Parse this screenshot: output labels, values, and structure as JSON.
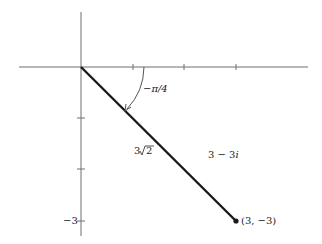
{
  "diagram": {
    "type": "complex-plane",
    "point": {
      "label": "(3, −3)",
      "complex": "3 − 3",
      "imag_unit": "i"
    },
    "modulus_label": {
      "coef": "3",
      "radicand": "2"
    },
    "angle_label": "−π/4",
    "y_tick_label": "−3",
    "x_ticks": [
      1,
      2,
      3
    ],
    "y_ticks": [
      -1,
      -2,
      -3
    ],
    "colors": {
      "axis": "#6e6e6e",
      "segment": "#1a1a1a",
      "text": "#222222"
    }
  }
}
